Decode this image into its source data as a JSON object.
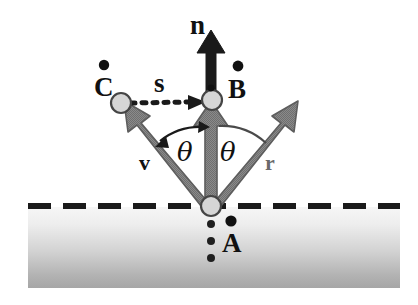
{
  "figure": {
    "background_color": "#ffffff",
    "width": 418,
    "height": 305
  },
  "labels": {
    "normal": "n",
    "view": "v",
    "reflect": "r",
    "halfway": "s",
    "theta_left": "θ",
    "theta_right": "θ",
    "point_a": "A",
    "point_b": "B",
    "point_c": "C"
  },
  "colors": {
    "arrow_gray": "#7d7d7d",
    "arrow_gray_edge": "#5a5a5a",
    "arrow_black": "#1a1a1a",
    "node_fill": "#d4d4d4",
    "node_stroke": "#4a4a4a",
    "surface_line": "#1a1a1a",
    "surface_top": "#f4f4f4",
    "surface_bottom": "#a9a9a9",
    "text": "#111111"
  },
  "geometry": {
    "origin": {
      "x": 211,
      "y": 206
    },
    "node_b": {
      "x": 211,
      "y": 100
    },
    "node_c": {
      "x": 120,
      "y": 103
    },
    "normal_tip": {
      "x": 211,
      "y": 30
    },
    "view_tip": {
      "x": 122,
      "y": 104
    },
    "reflect_tip": {
      "x": 293,
      "y": 104
    },
    "surface_y": 206,
    "surface_x_start": 28,
    "surface_x_end": 400,
    "slab_bottom": 288
  },
  "annotations": {
    "surface_style": "dashed",
    "s_arrow_style": "dotted-right",
    "a_marker_style": "dotted-down",
    "theta_arc_style": "double-headed"
  }
}
